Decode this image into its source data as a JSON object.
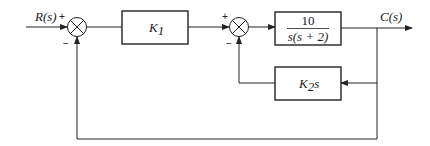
{
  "diagram": {
    "type": "control-system-block-diagram",
    "input": {
      "label": "R(s)"
    },
    "output": {
      "label": "C(s)"
    },
    "summing_junctions": [
      {
        "id": "sum1",
        "signs": {
          "top": "+",
          "bottom": "−"
        }
      },
      {
        "id": "sum2",
        "signs": {
          "top": "+",
          "bottom": "−"
        }
      }
    ],
    "blocks": {
      "k1": {
        "label": "K",
        "sub": "1"
      },
      "plant": {
        "numerator": "10",
        "denominator": "s(s + 2)"
      },
      "k2s": {
        "label": "K",
        "sub": "2",
        "suffix": "s"
      }
    }
  }
}
